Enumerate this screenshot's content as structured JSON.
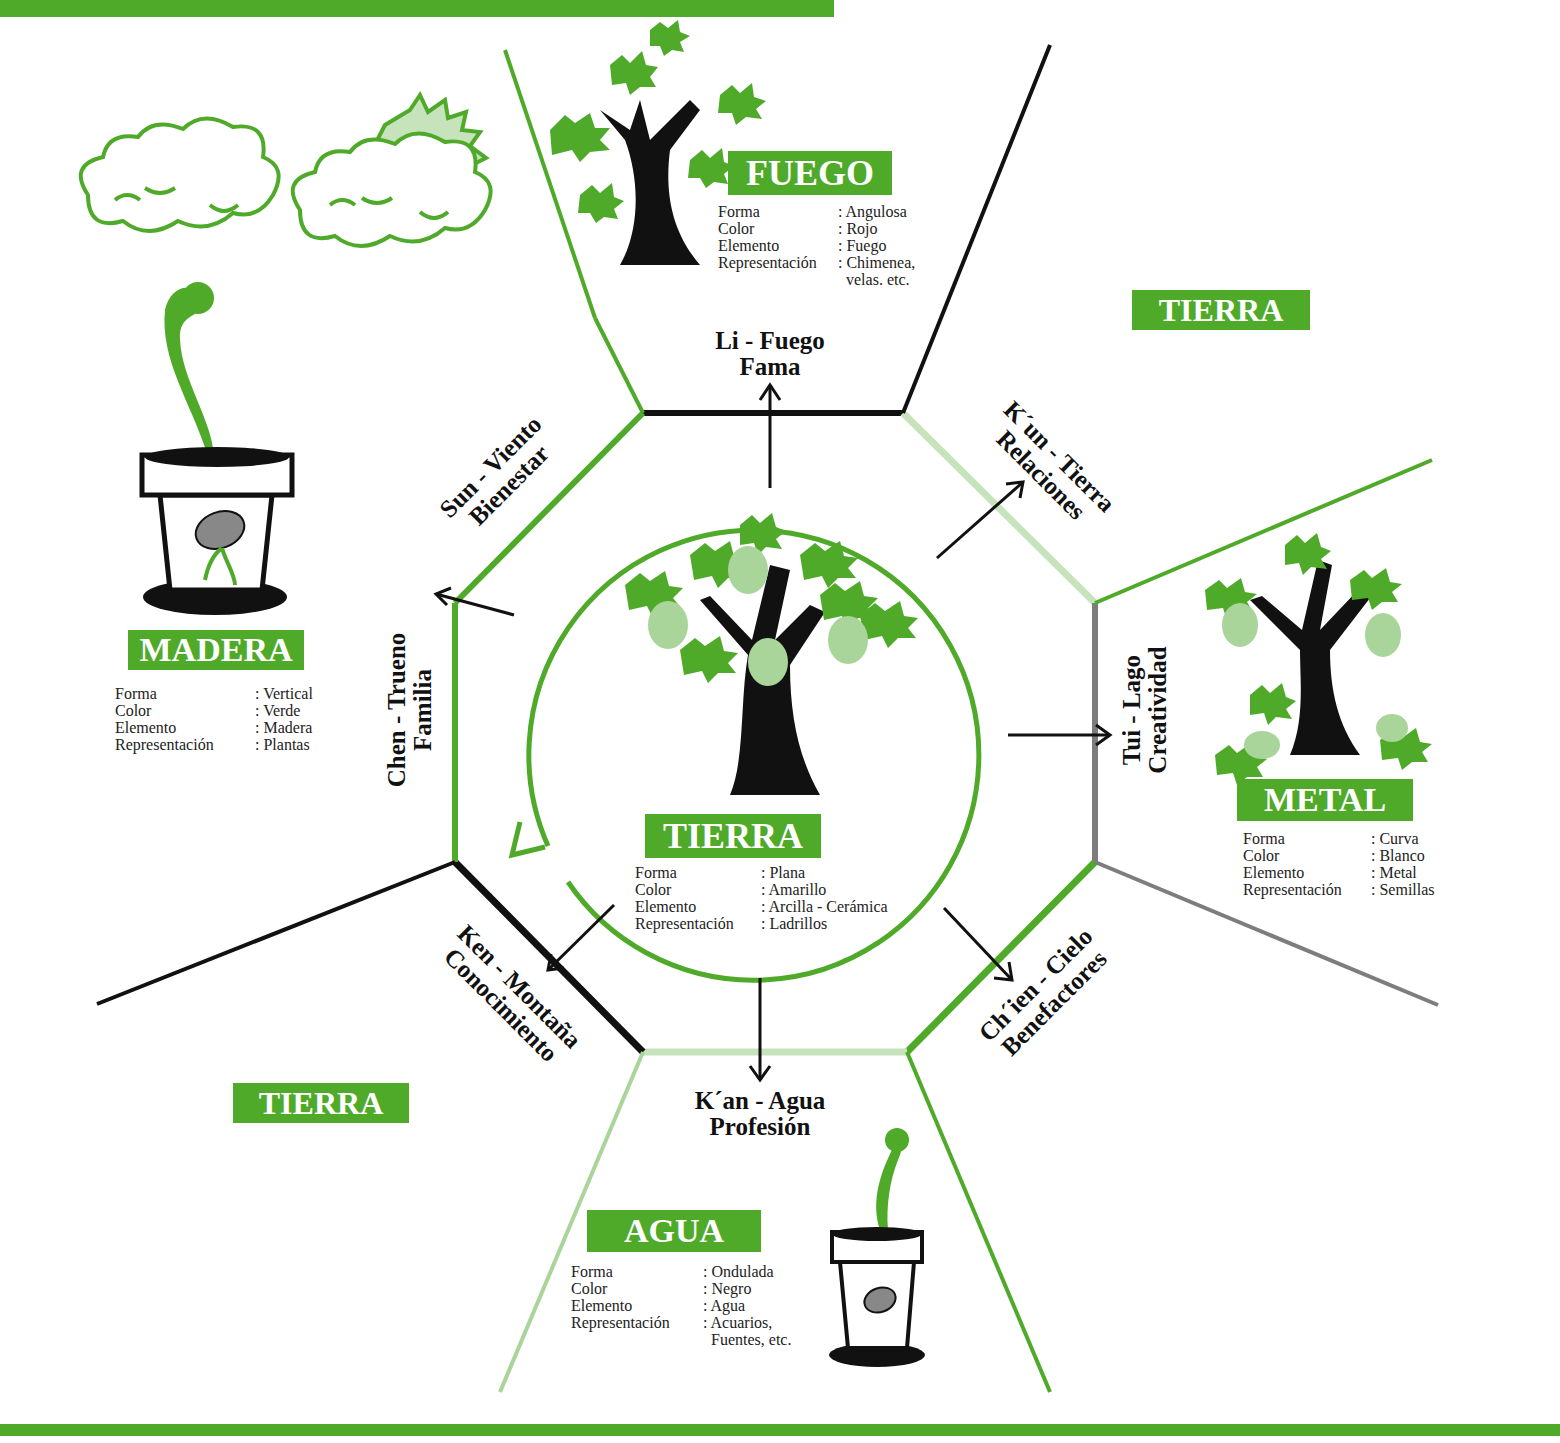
{
  "colors": {
    "accent_green": "#4faa2a",
    "light_green": "#a9d49a",
    "pale_green": "#c6e3bb",
    "black": "#111111",
    "gray": "#7d7d80"
  },
  "elements": {
    "fuego": {
      "title": "FUEGO",
      "props": [
        {
          "key": "Forma",
          "value": ": Angulosa"
        },
        {
          "key": "Color",
          "value": ": Rojo"
        },
        {
          "key": "Elemento",
          "value": ": Fuego"
        },
        {
          "key": "Representación",
          "value": ": Chimenea,"
        },
        {
          "key": "",
          "value": "  velas. etc."
        }
      ]
    },
    "madera": {
      "title": "MADERA",
      "props": [
        {
          "key": "Forma",
          "value": ": Vertical"
        },
        {
          "key": "Color",
          "value": ": Verde"
        },
        {
          "key": "Elemento",
          "value": ": Madera"
        },
        {
          "key": "Representación",
          "value": ": Plantas"
        }
      ]
    },
    "tierra_center": {
      "title": "TIERRA",
      "props": [
        {
          "key": "Forma",
          "value": ": Plana"
        },
        {
          "key": "Color",
          "value": ": Amarillo"
        },
        {
          "key": "Elemento",
          "value": ": Arcilla - Cerámica"
        },
        {
          "key": "Representación",
          "value": ": Ladrillos"
        }
      ]
    },
    "metal": {
      "title": "METAL",
      "props": [
        {
          "key": "Forma",
          "value": ": Curva"
        },
        {
          "key": "Color",
          "value": ": Blanco"
        },
        {
          "key": "Elemento",
          "value": ": Metal"
        },
        {
          "key": "Representación",
          "value": ": Semillas"
        }
      ]
    },
    "agua": {
      "title": "AGUA",
      "props": [
        {
          "key": "Forma",
          "value": ": Ondulada"
        },
        {
          "key": "Color",
          "value": ": Negro"
        },
        {
          "key": "Elemento",
          "value": ": Agua"
        },
        {
          "key": "Representación",
          "value": ": Acuarios,"
        },
        {
          "key": "",
          "value": "  Fuentes, etc."
        }
      ]
    },
    "tierra_top_right": {
      "title": "TIERRA"
    },
    "tierra_bottom_left": {
      "title": "TIERRA"
    }
  },
  "trigrams": {
    "li": {
      "line1": "Li - Fuego",
      "line2": "Fama"
    },
    "kun": {
      "line1": "K´un - Tierra",
      "line2": "Relaciones"
    },
    "tui": {
      "line1": "Tui - Lago",
      "line2": "Creatividad"
    },
    "chien": {
      "line1": "Ch´ien - Cielo",
      "line2": "Benefactores"
    },
    "kan": {
      "line1": "K´an - Agua",
      "line2": "Profesión"
    },
    "ken": {
      "line1": "Ken - Montaña",
      "line2": "Conocimiento"
    },
    "chen": {
      "line1": "Chen - Trueno",
      "line2": "Familia"
    },
    "sun": {
      "line1": "Sun - Viento",
      "line2": "Bienestar"
    }
  },
  "icons": [
    "cloud-icon",
    "cloud-with-sun-icon",
    "sprouting-pot-icon",
    "tree-fire-icon",
    "tree-earth-icon",
    "tree-metal-icon",
    "small-sprouting-pot-icon",
    "cycle-arrow-icon"
  ]
}
